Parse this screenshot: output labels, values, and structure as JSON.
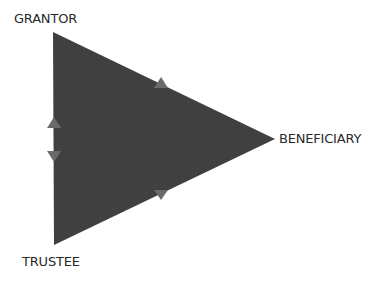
{
  "diagram": {
    "type": "trust-relationship-triangle",
    "nodes": [
      {
        "id": "grantor",
        "label": "GRANTOR",
        "position": "top-left"
      },
      {
        "id": "trustee",
        "label": "TRUSTEE",
        "position": "bottom-left"
      },
      {
        "id": "beneficiary",
        "label": "BENEFICIARY",
        "position": "right"
      }
    ],
    "edges": [
      {
        "from": "trustee",
        "to": "grantor",
        "direction": "up",
        "edge": "left"
      },
      {
        "from": "grantor",
        "to": "trustee",
        "direction": "down",
        "edge": "left"
      },
      {
        "from": "beneficiary",
        "to": "grantor",
        "direction": "up",
        "edge": "upper"
      },
      {
        "from": "trustee",
        "to": "beneficiary",
        "direction": "down",
        "edge": "lower"
      }
    ],
    "colors": {
      "triangle_fill": "#404040",
      "arrow_fill": "#6a6a6a",
      "label_text": "#2a2a2a",
      "background": "#ffffff"
    }
  }
}
